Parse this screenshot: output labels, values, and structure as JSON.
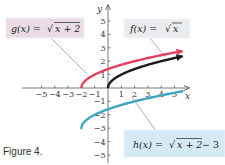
{
  "caption": "Figure 4.",
  "colors": {
    "g": "#e0415f",
    "f": "#1a1a1a",
    "h": "#3fa6c2",
    "axis": "#555555",
    "g_box": "#e9dce7",
    "f_box": "#ebecef",
    "h_box": "#d6eaf5"
  },
  "labels": {
    "g": {
      "name": "g(x) = ",
      "radicand": "x + 2",
      "suffix": ""
    },
    "f": {
      "name": "f(x) = ",
      "radicand": "x",
      "suffix": ""
    },
    "h": {
      "name": "h(x) = ",
      "radicand": "x + 2",
      "suffix": " − 3"
    }
  },
  "chart_data": {
    "type": "line",
    "title": "",
    "xlabel": "x",
    "ylabel": "y",
    "xlim": [
      -5.5,
      6
    ],
    "ylim": [
      -5.5,
      6
    ],
    "grid": false,
    "x_ticks": [
      -5,
      -4,
      -3,
      -2,
      -1,
      1,
      2,
      3,
      4,
      5
    ],
    "y_ticks": [
      -5,
      -4,
      -3,
      -2,
      -1,
      1,
      2,
      3,
      4,
      5
    ],
    "x_tick_labels": [
      "−5",
      "−4",
      "−3",
      "−2",
      "−1",
      "1",
      "2",
      "3",
      "4",
      "5"
    ],
    "y_tick_labels": [
      "−5",
      "−4",
      "−3",
      "−2",
      "−1",
      "1",
      "2",
      "3",
      "4",
      "5"
    ],
    "series": [
      {
        "name": "g(x) = √(x + 2)",
        "formula": "sqrt(x+2)",
        "domain_start": -2,
        "domain_end": 5.6,
        "color": "#e0415f",
        "arrow": true,
        "x": [
          -2,
          -1,
          0,
          1,
          2,
          3,
          4,
          5
        ],
        "y": [
          0,
          1,
          1.41,
          1.73,
          2,
          2.24,
          2.45,
          2.65
        ]
      },
      {
        "name": "f(x) = √x",
        "formula": "sqrt(x)",
        "domain_start": 0,
        "domain_end": 5.6,
        "color": "#1a1a1a",
        "arrow": true,
        "x": [
          0,
          1,
          2,
          3,
          4,
          5
        ],
        "y": [
          0,
          1,
          1.41,
          1.73,
          2,
          2.24
        ]
      },
      {
        "name": "h(x) = √(x + 2) − 3",
        "formula": "sqrt(x+2)-3",
        "domain_start": -2,
        "domain_end": 5.6,
        "color": "#3fa6c2",
        "arrow": false,
        "x": [
          -2,
          -1,
          0,
          1,
          2,
          3,
          4,
          5
        ],
        "y": [
          -3,
          -2,
          -1.59,
          -1.27,
          -1,
          -0.76,
          -0.55,
          -0.35
        ]
      }
    ],
    "annotations": [
      {
        "text": "g(x) = √(x + 2)",
        "position": "upper-left"
      },
      {
        "text": "f(x) = √x",
        "position": "upper-right"
      },
      {
        "text": "h(x) = √(x + 2) − 3",
        "position": "lower-right"
      }
    ]
  }
}
